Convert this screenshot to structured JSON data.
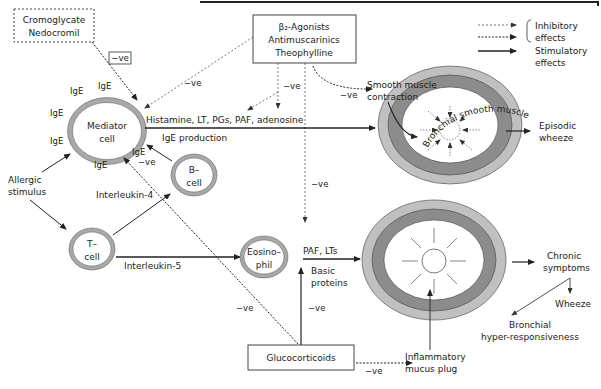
{
  "drugs": {
    "cromoglycate": [
      "Cromoglycate",
      "Nedocromil"
    ],
    "bronchodilators": [
      "β₂-Agonists",
      "Antimuscarinics",
      "Theophylline"
    ],
    "glucocorticoids": "Glucocorticoids"
  },
  "legend": {
    "inhibitory": [
      "Inhibitory",
      "effects"
    ],
    "stimulatory": [
      "Stimulatory",
      "effects"
    ]
  },
  "cells": {
    "mediator": [
      "Mediator",
      "cell"
    ],
    "b_cell": [
      "B–",
      "cell"
    ],
    "t_cell": [
      "T–",
      "cell"
    ],
    "eosinophil": [
      "Eosino–",
      "phil"
    ]
  },
  "labels": {
    "ige": "IgE",
    "neg": "−ve",
    "allergic_stimulus": [
      "Allergic",
      "stimulus"
    ],
    "interleukin4": "Interleukin-4",
    "interleukin5": "Interleukin-5",
    "mediators": "Histamine, LT, PGs, PAF, adenosine",
    "ige_production": "IgE production",
    "paf_lts": "PAF, LTs",
    "basic_proteins": [
      "Basic",
      "proteins"
    ],
    "smooth_muscle": [
      "Smooth muscle",
      "contraction"
    ],
    "bronchial_smooth_muscle": "Bronchial smooth muscle",
    "episodic_wheeze": [
      "Episodic",
      "wheeze"
    ],
    "chronic_symptoms": [
      "Chronic",
      "symptoms"
    ],
    "wheeze": "Wheeze",
    "bhr": [
      "Bronchial",
      "hyper-responsiveness"
    ],
    "mucus_plug": [
      "Inflammatory",
      "mucus plug"
    ]
  },
  "colors": {
    "outer_ring": "#b8b8b8",
    "inner_ring": "#8a8a8a",
    "cell_ring": "#a8a8a8",
    "line": "#222222"
  }
}
